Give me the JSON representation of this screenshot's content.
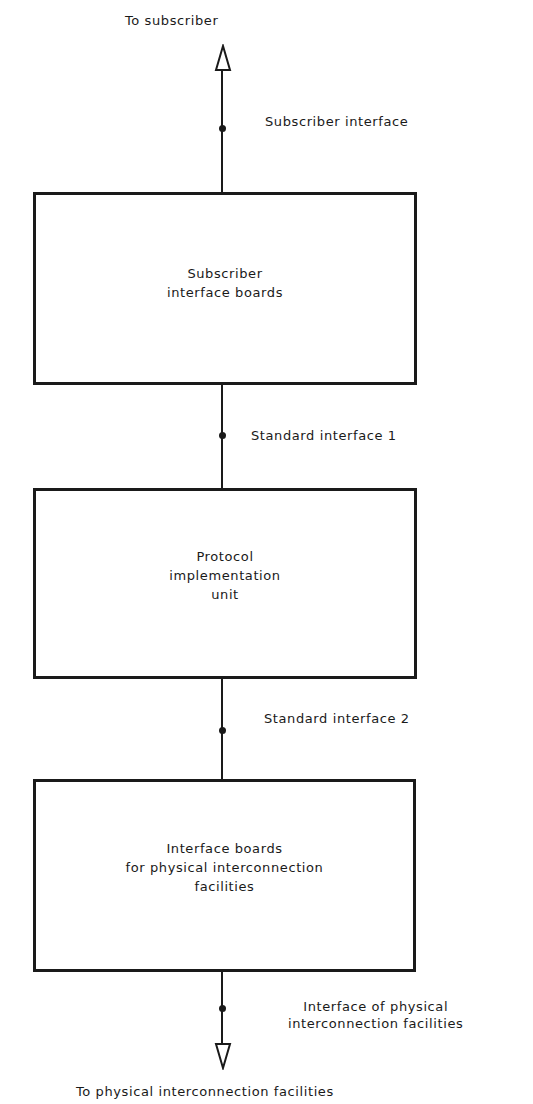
{
  "diagram": {
    "type": "block-diagram",
    "orientation": "vertical",
    "top_endpoint": {
      "label": "To subscriber",
      "arrow": "up-open-triangle"
    },
    "bottom_endpoint": {
      "label": "To physical interconnection facilities",
      "arrow": "down-open-triangle"
    },
    "boxes": [
      {
        "lines": [
          "Subscriber",
          "interface boards"
        ]
      },
      {
        "lines": [
          "Protocol",
          "implementation",
          "unit"
        ]
      },
      {
        "lines": [
          "Interface boards",
          "for physical interconnection",
          "facilities"
        ]
      }
    ],
    "interfaces": [
      {
        "lines": [
          "Subscriber interface"
        ]
      },
      {
        "lines": [
          "Standard interface 1"
        ]
      },
      {
        "lines": [
          "Standard interface 2"
        ]
      },
      {
        "lines": [
          "Interface of physical",
          "interconnection facilities"
        ]
      }
    ],
    "colors": {
      "line": "#1a1a1a",
      "background": "#ffffff"
    }
  }
}
